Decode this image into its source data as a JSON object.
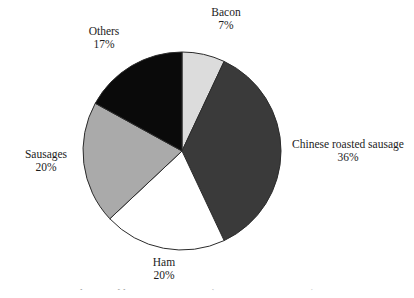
{
  "figure": {
    "background_color": "#ffffff",
    "caption_fragment": "2-2  Chinese meat product types in Chinese 2010 (source: estimation data)"
  },
  "chart_data": {
    "type": "pie",
    "title": "",
    "xlabel": "",
    "ylabel": "",
    "legend_position": "none",
    "grid": false,
    "label_format": "name + percentage, placed outside slices",
    "start_angle_deg": 0,
    "direction": "clockwise",
    "center": {
      "x": 182,
      "y": 151
    },
    "radius": 99,
    "outline_color": "#2b2b2b",
    "categories": [
      "Bacon",
      "Chinese roasted sausage",
      "Ham",
      "Sausages",
      "Others"
    ],
    "values": [
      7,
      36,
      20,
      20,
      17
    ],
    "value_labels": [
      "7%",
      "20%",
      "20%",
      "17%",
      "36%"
    ],
    "slices": [
      {
        "name": "Bacon",
        "value": 7,
        "percent_label": "7%",
        "color": "#dcdcdc"
      },
      {
        "name": "Chinese roasted sausage",
        "value": 36,
        "percent_label": "36%",
        "color": "#3a3a3a"
      },
      {
        "name": "Ham",
        "value": 20,
        "percent_label": "20%",
        "color": "#ffffff"
      },
      {
        "name": "Sausages",
        "value": 20,
        "percent_label": "20%",
        "color": "#aaaaaa"
      },
      {
        "name": "Others",
        "value": 17,
        "percent_label": "17%",
        "color": "#0a0a0a"
      }
    ]
  }
}
